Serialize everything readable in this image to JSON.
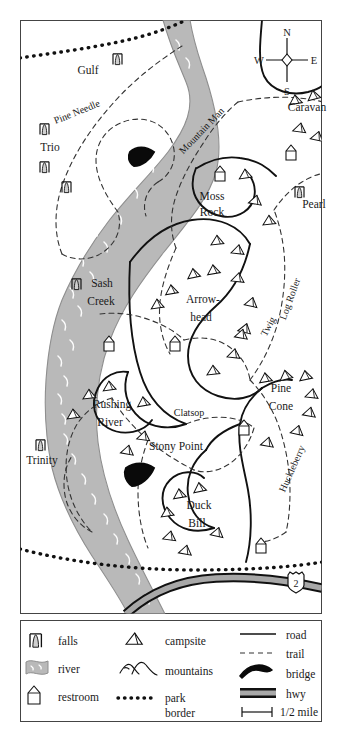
{
  "map": {
    "title": "National Park Trail Map",
    "colors": {
      "river": "#b9b9b9",
      "river_stroke": "#8f8f8f",
      "hwy_fill": "#a8a8a8",
      "ink": "#1a1a1a",
      "paper": "#ffffff"
    },
    "compass": {
      "north": "N",
      "east": "E",
      "south": "S",
      "west": "W"
    },
    "highway": {
      "shield_number": "2"
    },
    "places": [
      {
        "name": "Gulf",
        "x": 88,
        "y": 74,
        "type": "falls-area"
      },
      {
        "name": "Trio",
        "x": 50,
        "y": 151,
        "type": "falls-area"
      },
      {
        "name": "Caravan",
        "x": 307,
        "y": 111,
        "type": "campground"
      },
      {
        "name": "Pearl",
        "x": 314,
        "y": 208,
        "type": "falls-area"
      },
      {
        "name": "Moss",
        "x": 212,
        "y": 200,
        "type": "campground"
      },
      {
        "name": "Rock",
        "x": 212,
        "y": 216,
        "type": "campground"
      },
      {
        "name": "Sash",
        "x": 102,
        "y": 287,
        "type": "falls-area"
      },
      {
        "name": "Creek",
        "x": 101,
        "y": 305,
        "type": "falls-area"
      },
      {
        "name": "Arrow-",
        "x": 203,
        "y": 303,
        "type": "campground"
      },
      {
        "name": "head",
        "x": 201,
        "y": 321,
        "type": "campground"
      },
      {
        "name": "Rushing",
        "x": 112,
        "y": 408,
        "type": "campground"
      },
      {
        "name": "River",
        "x": 110,
        "y": 426,
        "type": "campground"
      },
      {
        "name": "Pine",
        "x": 281,
        "y": 392,
        "type": "campground"
      },
      {
        "name": "Cone",
        "x": 281,
        "y": 410,
        "type": "campground"
      },
      {
        "name": "Trinity",
        "x": 42,
        "y": 464,
        "type": "falls-area"
      },
      {
        "name": "Duck",
        "x": 199,
        "y": 509,
        "type": "campground"
      },
      {
        "name": "Bill",
        "x": 197,
        "y": 527,
        "type": "campground"
      }
    ],
    "trails": [
      {
        "name": "Pine Needle",
        "x": 78,
        "y": 115,
        "rotate": -22
      },
      {
        "name": "Mountain Man",
        "x": 204,
        "y": 133,
        "rotate": -46
      },
      {
        "name": "Log Roller",
        "x": 293,
        "y": 300,
        "rotate": -70
      },
      {
        "name": "Twig",
        "x": 271,
        "y": 328,
        "rotate": -62
      },
      {
        "name": "Clatsop",
        "x": 189,
        "y": 416,
        "rotate": 0
      },
      {
        "name": "Stony Point",
        "x": 176,
        "y": 450,
        "rotate": 0
      },
      {
        "name": "Huckleberry",
        "x": 295,
        "y": 470,
        "rotate": -66
      }
    ]
  },
  "legend": {
    "column1": [
      {
        "icon": "falls-icon",
        "label": "falls"
      },
      {
        "icon": "river-icon",
        "label": "river"
      },
      {
        "icon": "restroom-icon",
        "label": "restroom"
      }
    ],
    "column2": [
      {
        "icon": "campsite-icon",
        "label": "campsite"
      },
      {
        "icon": "mountains-icon",
        "label": "mountains"
      },
      {
        "icon": "park-border-icon",
        "label": "park",
        "label2": "border"
      }
    ],
    "column3": [
      {
        "icon": "road-icon",
        "label": "road"
      },
      {
        "icon": "trail-icon",
        "label": "trail"
      },
      {
        "icon": "bridge-icon",
        "label": "bridge"
      },
      {
        "icon": "hwy-icon",
        "label": "hwy"
      },
      {
        "icon": "scale-icon",
        "label": "1/2 mile"
      }
    ]
  }
}
